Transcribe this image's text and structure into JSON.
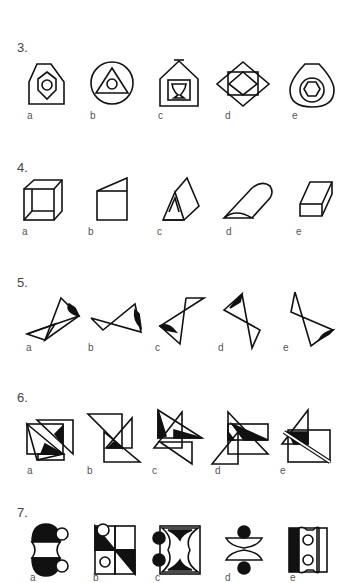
{
  "questions": [
    {
      "number": "3.",
      "options": [
        "a",
        "b",
        "c",
        "d",
        "e"
      ],
      "figures": [
        "pentagon-with-hexagon-and-circle",
        "circle-with-triangle-and-circle",
        "house-with-square-and-cup",
        "diamond-with-rectangle-and-diamond",
        "rounded-shape-with-circle-and-pentagon"
      ]
    },
    {
      "number": "4.",
      "options": [
        "a",
        "b",
        "c",
        "d",
        "e"
      ],
      "figures": [
        "hollow-cube",
        "square-with-slanted-top",
        "triangular-prism",
        "half-cylinder",
        "wedge-block"
      ]
    },
    {
      "number": "5.",
      "options": [
        "a",
        "b",
        "c",
        "d",
        "e"
      ],
      "figures": [
        "bowtie-triangles-a",
        "bowtie-triangles-b",
        "bowtie-triangles-c",
        "bowtie-triangles-d",
        "bowtie-triangles-e"
      ]
    },
    {
      "number": "6.",
      "options": [
        "a",
        "b",
        "c",
        "d",
        "e"
      ],
      "figures": [
        "overlapping-triangles-a",
        "overlapping-triangles-b",
        "overlapping-triangles-c",
        "overlapping-triangles-d",
        "overlapping-triangles-e"
      ]
    },
    {
      "number": "7.",
      "options": [
        "a",
        "b",
        "c",
        "d",
        "e"
      ],
      "figures": [
        "hourglass-circle-with-dots",
        "split-squares-with-circles",
        "star-square-with-dots",
        "lens-shapes-with-dots",
        "bar-rectangle-with-circles"
      ]
    }
  ]
}
